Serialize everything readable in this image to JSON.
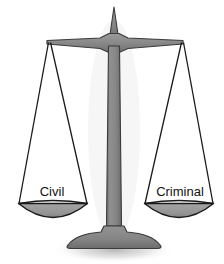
{
  "image": {
    "title": "Scales of Justice",
    "subject": "balance-scale",
    "background_color": "#ffffff",
    "width": 224,
    "height": 264
  },
  "colors": {
    "metal_gray": "#8a8a8a",
    "metal_gray_dark": "#6f6f6f",
    "metal_outline": "#3b3b3b",
    "pan_fill": "#9a9a9a",
    "pan_outline": "#1a1a1a",
    "string": "#1a1a1a",
    "shadow": "#b9b9b9",
    "label_text": "#111111"
  },
  "scale": {
    "finial": {
      "name": "finial-spike"
    },
    "beam": {
      "name": "balance-beam"
    },
    "column": {
      "name": "center-column"
    },
    "base": {
      "name": "base-foot"
    },
    "shadow": {
      "name": "ground-shadow"
    }
  },
  "pans": [
    {
      "side": "left",
      "label": "Civil",
      "name": "pan-left",
      "label_x": 52,
      "label_y": 196
    },
    {
      "side": "right",
      "label": "Criminal",
      "name": "pan-right",
      "label_x": 180,
      "label_y": 196
    }
  ]
}
